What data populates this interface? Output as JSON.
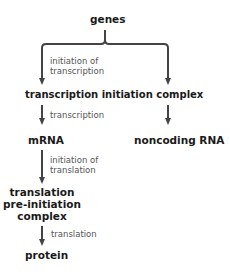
{
  "diagram": {
    "nodes": {
      "genes": "genes",
      "tic": "transcription initiation complex",
      "mrna": "mRNA",
      "ncrna": "noncoding RNA",
      "tpic_line1": "translation",
      "tpic_line2": "pre-initiation",
      "tpic_line3": "complex",
      "protein": "protein"
    },
    "edge_labels": {
      "init_transcription_1": "initiation of",
      "init_transcription_2": "transcription",
      "transcription": "transcription",
      "init_translation_1": "initiation of",
      "init_translation_2": "translation",
      "translation": "translation"
    },
    "colors": {
      "arrow": "#444444",
      "node_text": "#1a1a1a",
      "label_text": "#555555"
    }
  }
}
